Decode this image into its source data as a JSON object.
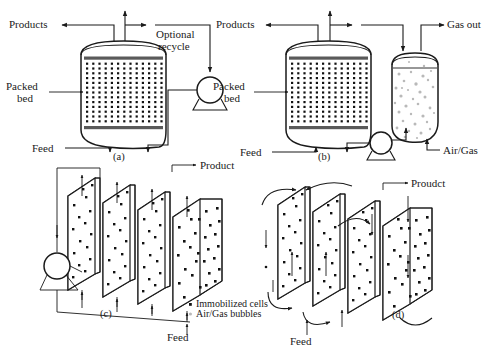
{
  "figure": {
    "background_color": "#ffffff",
    "ink_color": "#1a1a1a",
    "cell_dot_color": "#111111",
    "bubble_dot_color": "#b9b9b9"
  },
  "panel_a": {
    "id": "(a)",
    "label_products": "Products",
    "label_optional_recycle_line1": "Optional",
    "label_optional_recycle_line2": "recycle",
    "label_packed_bed_line1": "Packed",
    "label_packed_bed_line2": "bed",
    "label_feed": "Feed",
    "vessel_type": "packed-bed-column",
    "has_pump": true
  },
  "panel_b": {
    "id": "(b)",
    "label_products": "Products",
    "label_gas_out": "Gas out",
    "label_packed_bed_line1": "Packed",
    "label_packed_bed_line2": "bed",
    "label_feed": "Feed",
    "label_air_gas": "Air/Gas",
    "vessel_type": "packed-bed-column-with-bubble-column",
    "has_pump": true
  },
  "panel_c": {
    "id": "(c)",
    "label_product": "Product",
    "label_feed": "Feed",
    "plate_count": 4,
    "has_pump": true,
    "flow": "upward-parallel"
  },
  "panel_d": {
    "id": "(d)",
    "label_product": "Proudct",
    "label_feed": "Feed",
    "plate_count": 4,
    "has_pump": false,
    "flow": "serpentine"
  },
  "legend": {
    "items": [
      {
        "marker": "bold-dot",
        "label": "Immobilized cells"
      },
      {
        "marker": "light-dot",
        "label": "Air/Gas bubbles"
      }
    ]
  }
}
